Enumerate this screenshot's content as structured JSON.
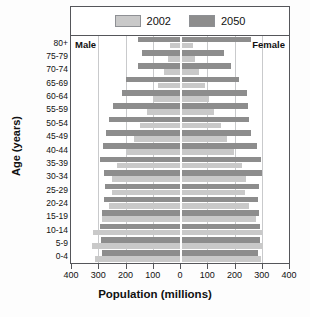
{
  "chart_data": {
    "type": "bar",
    "subtype": "population-pyramid",
    "title": "",
    "xlabel": "Population (millions)",
    "ylabel": "Age (years)",
    "xlim": [
      -400,
      400
    ],
    "xticks": [
      400,
      300,
      200,
      100,
      0,
      100,
      200,
      300,
      400
    ],
    "xtick_side_meaning": [
      "male",
      "male",
      "male",
      "male",
      "center",
      "female",
      "female",
      "female",
      "female"
    ],
    "grid": true,
    "legend_position": "top-inside",
    "side_labels": {
      "left": "Male",
      "right": "Female"
    },
    "categories": [
      "80+",
      "75-79",
      "70-74",
      "65-69",
      "60-64",
      "55-59",
      "50-54",
      "45-49",
      "40-44",
      "35-39",
      "30-34",
      "25-29",
      "20-24",
      "15-19",
      "10-14",
      "5-9",
      "0-4"
    ],
    "series": [
      {
        "name": "2002",
        "color": "#c9c9c9",
        "male": [
          35,
          44,
          60,
          80,
          100,
          120,
          145,
          170,
          195,
          232,
          250,
          248,
          262,
          285,
          320,
          322,
          312
        ],
        "female": [
          48,
          55,
          70,
          90,
          108,
          125,
          150,
          172,
          198,
          228,
          242,
          240,
          255,
          278,
          300,
          305,
          298
        ]
      },
      {
        "name": "2050",
        "color": "#8d8d8d",
        "male": [
          155,
          138,
          155,
          200,
          212,
          245,
          262,
          272,
          282,
          295,
          280,
          275,
          280,
          288,
          292,
          290,
          288
        ],
        "female": [
          262,
          160,
          188,
          218,
          245,
          250,
          252,
          262,
          282,
          298,
          300,
          290,
          288,
          290,
          295,
          295,
          285
        ]
      }
    ]
  },
  "legend": {
    "items": [
      {
        "label": "2002",
        "color": "#c9c9c9"
      },
      {
        "label": "2050",
        "color": "#8d8d8d"
      }
    ]
  },
  "axes": {
    "x_title": "Population (millions)",
    "y_title": "Age (years)",
    "x_tick_labels": [
      "400",
      "300",
      "200",
      "100",
      "0",
      "100",
      "200",
      "300",
      "400"
    ],
    "y_tick_labels": [
      "80+",
      "75-79",
      "70-74",
      "65-69",
      "60-64",
      "55-59",
      "50-54",
      "45-49",
      "40-44",
      "35-39",
      "30-34",
      "25-29",
      "20-24",
      "15-19",
      "10-14",
      "5-9",
      "0-4"
    ]
  },
  "annotations": {
    "male": "Male",
    "female": "Female"
  },
  "colors": {
    "series_2002": "#c9c9c9",
    "series_2050": "#8d8d8d",
    "frame": "#55565a",
    "grid": "#c9cacc",
    "text": "#111111",
    "background": "#ffffff"
  }
}
